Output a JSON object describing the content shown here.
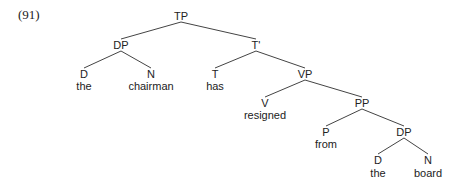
{
  "example_number": "(91)",
  "tree": {
    "nodes": [
      {
        "id": "TP",
        "label": "TP",
        "x": 181,
        "y": 16
      },
      {
        "id": "DP1",
        "label": "DP",
        "x": 121,
        "y": 45
      },
      {
        "id": "Tbar",
        "label": "T'",
        "x": 256,
        "y": 45
      },
      {
        "id": "D1",
        "label": "D",
        "x": 84,
        "y": 74
      },
      {
        "id": "N1",
        "label": "N",
        "x": 151,
        "y": 74
      },
      {
        "id": "T",
        "label": "T",
        "x": 215,
        "y": 74
      },
      {
        "id": "VP",
        "label": "VP",
        "x": 305,
        "y": 74
      },
      {
        "id": "V",
        "label": "V",
        "x": 265,
        "y": 103
      },
      {
        "id": "PP",
        "label": "PP",
        "x": 362,
        "y": 103
      },
      {
        "id": "P",
        "label": "P",
        "x": 326,
        "y": 132
      },
      {
        "id": "DP2",
        "label": "DP",
        "x": 404,
        "y": 132
      },
      {
        "id": "D2",
        "label": "D",
        "x": 378,
        "y": 160
      },
      {
        "id": "N2",
        "label": "N",
        "x": 428,
        "y": 160
      }
    ],
    "words": [
      {
        "under": "D1",
        "text": "the",
        "x": 84,
        "y": 86
      },
      {
        "under": "N1",
        "text": "chairman",
        "x": 151,
        "y": 86
      },
      {
        "under": "T",
        "text": "has",
        "x": 215,
        "y": 86
      },
      {
        "under": "V",
        "text": "resigned",
        "x": 265,
        "y": 115
      },
      {
        "under": "P",
        "text": "from",
        "x": 326,
        "y": 144
      },
      {
        "under": "D2",
        "text": "the",
        "x": 378,
        "y": 173
      },
      {
        "under": "N2",
        "text": "board",
        "x": 428,
        "y": 173
      }
    ],
    "edges": [
      [
        "TP",
        "DP1"
      ],
      [
        "TP",
        "Tbar"
      ],
      [
        "DP1",
        "D1"
      ],
      [
        "DP1",
        "N1"
      ],
      [
        "Tbar",
        "T"
      ],
      [
        "Tbar",
        "VP"
      ],
      [
        "VP",
        "V"
      ],
      [
        "VP",
        "PP"
      ],
      [
        "PP",
        "P"
      ],
      [
        "PP",
        "DP2"
      ],
      [
        "DP2",
        "D2"
      ],
      [
        "DP2",
        "N2"
      ]
    ],
    "colors": {
      "text": "#222222",
      "line": "#444444",
      "background": "#ffffff"
    }
  }
}
